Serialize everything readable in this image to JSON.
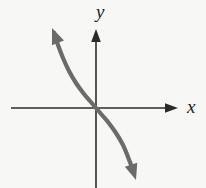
{
  "figure": {
    "kind": "coordinate-plane-graph",
    "background_color": "#f7f7f6",
    "width": 206,
    "height": 188
  },
  "axes": {
    "color": "#2b2b2b",
    "stroke_width": 1.6,
    "x_axis": {
      "label": "x",
      "start": [
        11,
        108
      ],
      "end": [
        178,
        108
      ],
      "arrow": "right"
    },
    "y_axis": {
      "label": "y",
      "start": [
        96,
        188
      ],
      "end": [
        96,
        29
      ],
      "arrow": "up"
    },
    "origin": [
      96,
      108
    ]
  },
  "chart_data": {
    "type": "line",
    "title": "",
    "xlabel": "x",
    "ylabel": "y",
    "grid": false,
    "legend": null,
    "curve": {
      "color": "#6b6b6b",
      "stroke_width": 4.2,
      "shape": "cubic-decreasing",
      "passes_through_origin": true,
      "points": [
        [
          54,
          33
        ],
        [
          58,
          45
        ],
        [
          63,
          58
        ],
        [
          69,
          71
        ],
        [
          76,
          83
        ],
        [
          84,
          94
        ],
        [
          90,
          101
        ],
        [
          96,
          108
        ],
        [
          102,
          115
        ],
        [
          108,
          122
        ],
        [
          116,
          133
        ],
        [
          123,
          145
        ],
        [
          128,
          157
        ],
        [
          133,
          170
        ]
      ],
      "start_arrow": {
        "direction": "up-left",
        "tip": [
          52,
          28
        ],
        "angle_deg": 248
      },
      "end_arrow": {
        "direction": "down-right",
        "tip": [
          136,
          180
        ],
        "angle_deg": 72
      }
    }
  }
}
